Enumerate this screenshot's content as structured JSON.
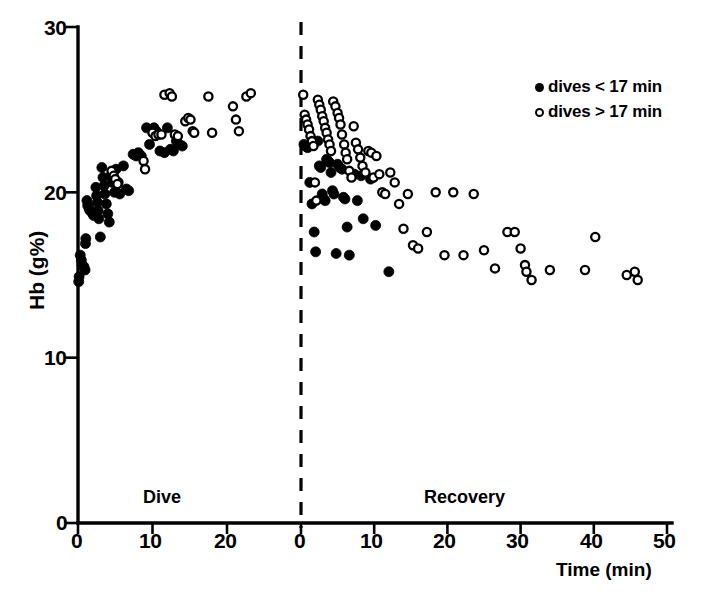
{
  "chart_data": {
    "type": "scatter",
    "title": "",
    "ylabel": "Hb (g%)",
    "xlabel": "Time (min)",
    "ylim": [
      0,
      30
    ],
    "yticks": [
      0,
      10,
      20,
      30
    ],
    "grid": false,
    "panels": [
      {
        "name": "dive",
        "label": "Dive",
        "xlim": [
          0,
          24
        ],
        "xticks": [
          0,
          10,
          20
        ],
        "xtick_labels": [
          "0",
          "10",
          "20"
        ]
      },
      {
        "name": "recovery",
        "label": "Recovery",
        "xlim": [
          0,
          50
        ],
        "xticks": [
          0,
          10,
          20,
          30,
          40,
          50
        ],
        "xtick_labels": [
          "0",
          "10",
          "20",
          "30",
          "40",
          "50"
        ]
      }
    ],
    "legend": {
      "position": "top-right",
      "entries": [
        {
          "marker": "filled-circle",
          "label": "dives < 17 min"
        },
        {
          "marker": "open-circle",
          "label": "dives > 17 min"
        }
      ]
    },
    "series": [
      {
        "name": "dives < 17 min",
        "marker": "filled-circle",
        "color": "#000000",
        "panel": "dive",
        "points": [
          [
            0.1,
            14.6
          ],
          [
            0.15,
            14.9
          ],
          [
            0.3,
            16.2
          ],
          [
            0.45,
            15.9
          ],
          [
            0.55,
            15.6
          ],
          [
            0.8,
            15.5
          ],
          [
            0.95,
            15.3
          ],
          [
            1.0,
            16.9
          ],
          [
            1.05,
            17.2
          ],
          [
            1.2,
            19.5
          ],
          [
            1.3,
            19.2
          ],
          [
            1.5,
            19.0
          ],
          [
            1.6,
            18.9
          ],
          [
            1.85,
            18.8
          ],
          [
            2.0,
            18.7
          ],
          [
            2.1,
            18.6
          ],
          [
            2.4,
            20.3
          ],
          [
            2.5,
            19.8
          ],
          [
            2.6,
            19.4
          ],
          [
            2.7,
            18.9
          ],
          [
            2.8,
            18.4
          ],
          [
            3.0,
            17.3
          ],
          [
            3.2,
            21.5
          ],
          [
            3.35,
            20.9
          ],
          [
            3.5,
            20.4
          ],
          [
            3.6,
            19.9
          ],
          [
            3.8,
            19.3
          ],
          [
            4.0,
            18.7
          ],
          [
            4.2,
            18.2
          ],
          [
            4.4,
            21.0
          ],
          [
            4.6,
            20.6
          ],
          [
            4.9,
            20.0
          ],
          [
            5.1,
            21.4
          ],
          [
            5.4,
            20.6
          ],
          [
            5.6,
            19.9
          ],
          [
            6.1,
            21.6
          ],
          [
            6.5,
            20.2
          ],
          [
            6.8,
            20.1
          ],
          [
            7.4,
            22.3
          ],
          [
            7.8,
            22.2
          ],
          [
            8.1,
            22.4
          ],
          [
            8.5,
            22.2
          ],
          [
            9.2,
            23.9
          ],
          [
            9.6,
            22.9
          ],
          [
            10.2,
            23.9
          ],
          [
            10.5,
            23.7
          ],
          [
            11.0,
            22.5
          ],
          [
            11.6,
            22.4
          ],
          [
            12.0,
            23.9
          ],
          [
            12.4,
            22.6
          ],
          [
            12.8,
            22.5
          ],
          [
            13.2,
            23.1
          ],
          [
            13.6,
            22.9
          ],
          [
            14.0,
            22.8
          ]
        ]
      },
      {
        "name": "dives > 17 min",
        "marker": "open-circle",
        "color": "#000000",
        "panel": "dive",
        "points": [
          [
            4.5,
            21.3
          ],
          [
            4.8,
            21.0
          ],
          [
            5.0,
            20.8
          ],
          [
            5.3,
            20.5
          ],
          [
            8.8,
            21.9
          ],
          [
            9.0,
            21.4
          ],
          [
            10.0,
            23.6
          ],
          [
            10.4,
            23.4
          ],
          [
            10.8,
            23.5
          ],
          [
            11.2,
            23.5
          ],
          [
            11.6,
            25.9
          ],
          [
            12.3,
            26.0
          ],
          [
            12.6,
            25.8
          ],
          [
            13.0,
            23.5
          ],
          [
            13.4,
            23.4
          ],
          [
            14.4,
            24.3
          ],
          [
            14.8,
            24.5
          ],
          [
            15.1,
            24.4
          ],
          [
            15.4,
            23.7
          ],
          [
            15.6,
            23.6
          ],
          [
            17.5,
            25.8
          ],
          [
            18.0,
            23.6
          ],
          [
            20.8,
            25.2
          ],
          [
            21.2,
            24.4
          ],
          [
            21.6,
            23.7
          ],
          [
            22.6,
            25.8
          ],
          [
            23.2,
            26.0
          ]
        ]
      },
      {
        "name": "dives < 17 min",
        "marker": "filled-circle",
        "color": "#000000",
        "panel": "recovery",
        "points": [
          [
            0.4,
            22.9
          ],
          [
            0.6,
            22.8
          ],
          [
            0.9,
            22.7
          ],
          [
            1.2,
            20.6
          ],
          [
            1.5,
            19.3
          ],
          [
            1.8,
            17.6
          ],
          [
            2.0,
            16.4
          ],
          [
            2.3,
            23.1
          ],
          [
            2.5,
            21.6
          ],
          [
            2.7,
            21.5
          ],
          [
            2.9,
            19.9
          ],
          [
            3.1,
            19.6
          ],
          [
            3.3,
            19.5
          ],
          [
            3.5,
            22.0
          ],
          [
            3.7,
            21.9
          ],
          [
            3.9,
            21.8
          ],
          [
            4.1,
            21.2
          ],
          [
            4.3,
            20.1
          ],
          [
            4.5,
            19.9
          ],
          [
            4.8,
            16.3
          ],
          [
            5.0,
            21.7
          ],
          [
            5.3,
            21.5
          ],
          [
            5.6,
            21.4
          ],
          [
            5.8,
            19.7
          ],
          [
            6.0,
            19.6
          ],
          [
            6.3,
            17.9
          ],
          [
            6.6,
            16.2
          ],
          [
            7.3,
            21.1
          ],
          [
            7.7,
            19.5
          ],
          [
            8.2,
            21.0
          ],
          [
            8.5,
            18.4
          ],
          [
            9.5,
            20.8
          ],
          [
            10.2,
            18.0
          ],
          [
            12.0,
            15.2
          ]
        ]
      },
      {
        "name": "dives > 17 min",
        "marker": "open-circle",
        "color": "#000000",
        "panel": "recovery",
        "points": [
          [
            0.3,
            25.9
          ],
          [
            0.5,
            24.7
          ],
          [
            0.7,
            24.4
          ],
          [
            0.9,
            24.1
          ],
          [
            1.1,
            23.8
          ],
          [
            1.3,
            23.4
          ],
          [
            1.5,
            23.1
          ],
          [
            1.7,
            22.8
          ],
          [
            1.9,
            20.6
          ],
          [
            2.1,
            19.5
          ],
          [
            2.3,
            25.6
          ],
          [
            2.5,
            25.3
          ],
          [
            2.7,
            25.0
          ],
          [
            2.9,
            24.6
          ],
          [
            3.1,
            24.3
          ],
          [
            3.3,
            23.9
          ],
          [
            3.5,
            23.6
          ],
          [
            3.7,
            23.2
          ],
          [
            3.9,
            22.9
          ],
          [
            4.1,
            22.5
          ],
          [
            4.4,
            25.5
          ],
          [
            4.7,
            25.2
          ],
          [
            5.0,
            24.8
          ],
          [
            5.2,
            24.5
          ],
          [
            5.4,
            24.1
          ],
          [
            5.6,
            23.5
          ],
          [
            5.9,
            22.9
          ],
          [
            6.1,
            22.4
          ],
          [
            6.3,
            22.0
          ],
          [
            6.6,
            21.3
          ],
          [
            6.9,
            20.9
          ],
          [
            7.2,
            24.0
          ],
          [
            7.5,
            23.0
          ],
          [
            7.8,
            22.6
          ],
          [
            8.1,
            22.1
          ],
          [
            8.4,
            21.6
          ],
          [
            8.8,
            21.2
          ],
          [
            9.2,
            22.5
          ],
          [
            9.6,
            22.4
          ],
          [
            9.9,
            20.9
          ],
          [
            10.3,
            22.2
          ],
          [
            10.7,
            21.1
          ],
          [
            11.1,
            20.0
          ],
          [
            11.5,
            19.9
          ],
          [
            12.2,
            21.2
          ],
          [
            12.8,
            20.6
          ],
          [
            13.4,
            19.3
          ],
          [
            14.0,
            17.8
          ],
          [
            14.6,
            19.9
          ],
          [
            15.3,
            16.8
          ],
          [
            16.0,
            16.6
          ],
          [
            17.2,
            17.6
          ],
          [
            18.4,
            20.0
          ],
          [
            19.6,
            16.2
          ],
          [
            20.8,
            20.0
          ],
          [
            22.2,
            16.2
          ],
          [
            23.6,
            19.9
          ],
          [
            25.0,
            16.5
          ],
          [
            26.5,
            15.4
          ],
          [
            28.2,
            17.6
          ],
          [
            29.2,
            17.6
          ],
          [
            30.0,
            16.6
          ],
          [
            30.6,
            15.6
          ],
          [
            30.8,
            15.2
          ],
          [
            31.5,
            14.7
          ],
          [
            34.0,
            15.3
          ],
          [
            38.8,
            15.3
          ],
          [
            40.2,
            17.3
          ],
          [
            44.5,
            15.0
          ],
          [
            45.6,
            15.2
          ],
          [
            46.0,
            14.7
          ]
        ]
      }
    ]
  },
  "geometry": {
    "y_top_px": 27,
    "y_bottom_px": 523,
    "dive_x0_px": 78,
    "dive_px_per_min": 7.45,
    "rec_x0_px": 301,
    "rec_px_per_min": 7.32
  },
  "labels": {
    "ytick_0": "0",
    "ytick_10": "10",
    "ytick_20": "20",
    "ytick_30": "30",
    "y_axis_title": "Hb (g%)",
    "x_axis_title": "Time (min)",
    "dive_phase": "Dive",
    "recovery_phase": "Recovery",
    "dive_tick_0": "0",
    "dive_tick_10": "10",
    "dive_tick_20": "20",
    "rec_tick_0": "0",
    "rec_tick_10": "10",
    "rec_tick_20": "20",
    "rec_tick_30": "30",
    "rec_tick_40": "40",
    "rec_tick_50": "50"
  },
  "legend": {
    "entry_1": "dives < 17 min",
    "entry_2": "dives > 17 min"
  }
}
